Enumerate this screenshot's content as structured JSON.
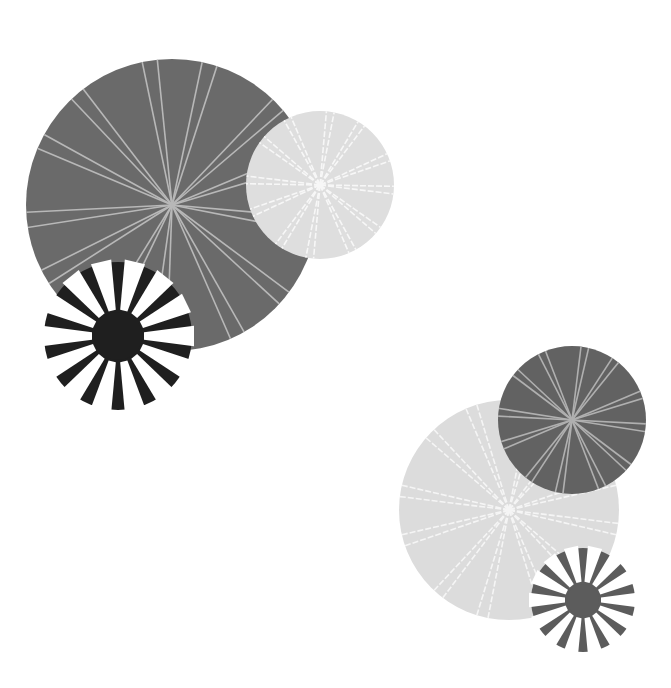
{
  "background": "#ffffff",
  "groups": [
    {
      "name": "top-left-group",
      "circles": [
        {
          "name": "large-dark-ray-circle",
          "type": "rays",
          "cx": 172,
          "cy": 205,
          "r": 146,
          "fill": "#6a6a6a",
          "ray_color": "#b8b8b8",
          "rays": 13,
          "dashed": false,
          "rotation": 8
        },
        {
          "name": "small-light-ray-circle",
          "type": "rays",
          "cx": 320,
          "cy": 185,
          "r": 74,
          "fill": "#dedede",
          "ray_color": "#f7f7f7",
          "rays": 12,
          "dashed": true,
          "rotation": 4
        },
        {
          "name": "black-burst-circle",
          "type": "burst",
          "cx": 118,
          "cy": 336,
          "r": 74,
          "fill": "#1f1f1f",
          "hub_r": 24,
          "petals": 14,
          "petal_color_inside": "#6a6a6a",
          "petal_color_outside": "#ffffff",
          "rotation": 0
        }
      ]
    },
    {
      "name": "bottom-right-group",
      "circles": [
        {
          "name": "large-light-ray-circle",
          "type": "rays",
          "cx": 509,
          "cy": 510,
          "r": 110,
          "fill": "#dcdcdc",
          "ray_color": "#f5f5f5",
          "rays": 12,
          "dashed": true,
          "rotation": 10
        },
        {
          "name": "dark-ray-circle",
          "type": "rays",
          "cx": 572,
          "cy": 420,
          "r": 74,
          "fill": "#626262",
          "ray_color": "#b0b0b0",
          "rays": 12,
          "dashed": false,
          "rotation": 6
        },
        {
          "name": "gray-burst-circle",
          "type": "burst",
          "cx": 583,
          "cy": 600,
          "r": 52,
          "fill": "#5c5c5c",
          "hub_r": 16,
          "petals": 14,
          "petal_color_inside": "#dcdcdc",
          "petal_color_outside": "#ffffff",
          "rotation": 0
        }
      ]
    }
  ]
}
